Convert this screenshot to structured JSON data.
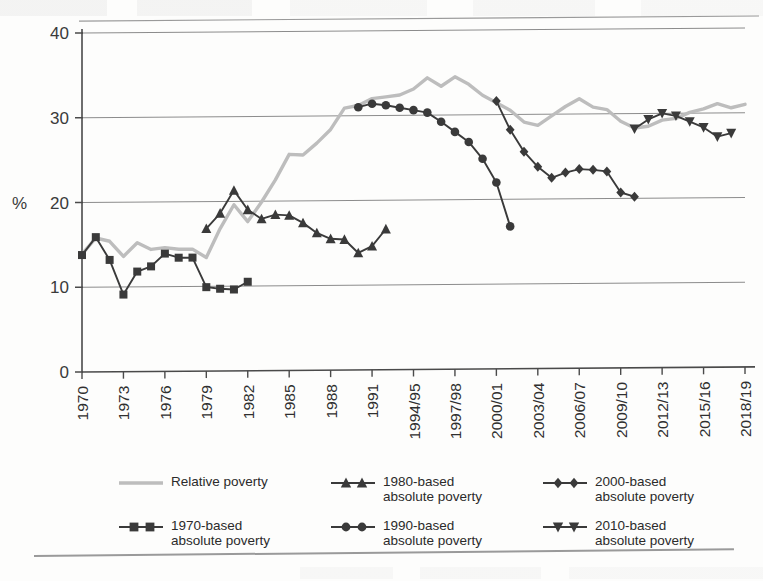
{
  "axes": {
    "ylabel": "%",
    "yticks": [
      "0",
      "10",
      "20",
      "30",
      "40"
    ],
    "ylim": [
      0,
      40
    ],
    "xticks": [
      "1970",
      "1973",
      "1976",
      "1979",
      "1982",
      "1985",
      "1988",
      "1991",
      "1994/95",
      "1997/98",
      "2000/01",
      "2003/04",
      "2006/07",
      "2009/10",
      "2012/13",
      "2015/16",
      "2018/19"
    ]
  },
  "legend": {
    "items": [
      {
        "key": "relative",
        "label": "Relative poverty",
        "marker": "line",
        "color": "#bdbdbd"
      },
      {
        "key": "b1980",
        "label": "1980-based\nabsolute poverty",
        "marker": "triangle-up",
        "color": "#3a3a3a"
      },
      {
        "key": "b2000",
        "label": "2000-based\nabsolute poverty",
        "marker": "diamond",
        "color": "#3a3a3a"
      },
      {
        "key": "b1970",
        "label": "1970-based\nabsolute poverty",
        "marker": "square",
        "color": "#3a3a3a"
      },
      {
        "key": "b1990",
        "label": "1990-based\nabsolute poverty",
        "marker": "circle",
        "color": "#3a3a3a"
      },
      {
        "key": "b2010",
        "label": "2010-based\nabsolute poverty",
        "marker": "triangle-down",
        "color": "#3a3a3a"
      }
    ]
  },
  "chart_data": {
    "type": "line",
    "title": "",
    "xlabel": "",
    "ylabel": "%",
    "ylim": [
      0,
      40
    ],
    "grid": "horizontal",
    "legend_position": "bottom",
    "categories": [
      "1970",
      "1971",
      "1972",
      "1973",
      "1974",
      "1975",
      "1976",
      "1977",
      "1978",
      "1979",
      "1980",
      "1981",
      "1982",
      "1983",
      "1984",
      "1985",
      "1986",
      "1987",
      "1988",
      "1989",
      "1990",
      "1991",
      "1992/93",
      "1993/94",
      "1994/95",
      "1995/96",
      "1996/97",
      "1997/98",
      "1998/99",
      "1999/00",
      "2000/01",
      "2001/02",
      "2002/03",
      "2003/04",
      "2004/05",
      "2005/06",
      "2006/07",
      "2007/08",
      "2008/09",
      "2009/10",
      "2010/11",
      "2011/12",
      "2012/13",
      "2013/14",
      "2014/15",
      "2015/16",
      "2016/17",
      "2017/18",
      "2018/19"
    ],
    "series": [
      {
        "name": "Relative poverty",
        "marker": "line",
        "color": "#bdbdbd",
        "points": [
          {
            "x": "1970",
            "y": 13.9
          },
          {
            "x": "1971",
            "y": 15.8
          },
          {
            "x": "1972",
            "y": 15.4
          },
          {
            "x": "1973",
            "y": 13.6
          },
          {
            "x": "1974",
            "y": 15.2
          },
          {
            "x": "1975",
            "y": 14.4
          },
          {
            "x": "1976",
            "y": 14.6
          },
          {
            "x": "1977",
            "y": 14.4
          },
          {
            "x": "1978",
            "y": 14.4
          },
          {
            "x": "1979",
            "y": 13.4
          },
          {
            "x": "1980",
            "y": 16.8
          },
          {
            "x": "1981",
            "y": 19.6
          },
          {
            "x": "1982",
            "y": 17.6
          },
          {
            "x": "1983",
            "y": 19.9
          },
          {
            "x": "1984",
            "y": 22.5
          },
          {
            "x": "1985",
            "y": 25.5
          },
          {
            "x": "1986",
            "y": 25.4
          },
          {
            "x": "1987",
            "y": 26.8
          },
          {
            "x": "1988",
            "y": 28.4
          },
          {
            "x": "1989",
            "y": 30.9
          },
          {
            "x": "1990",
            "y": 31.2
          },
          {
            "x": "1991",
            "y": 32.0
          },
          {
            "x": "1992/93",
            "y": 32.2
          },
          {
            "x": "1993/94",
            "y": 32.4
          },
          {
            "x": "1994/95",
            "y": 33.1
          },
          {
            "x": "1995/96",
            "y": 34.4
          },
          {
            "x": "1996/97",
            "y": 33.4
          },
          {
            "x": "1997/98",
            "y": 34.5
          },
          {
            "x": "1998/99",
            "y": 33.6
          },
          {
            "x": "1999/00",
            "y": 32.3
          },
          {
            "x": "2000/01",
            "y": 31.4
          },
          {
            "x": "2001/02",
            "y": 30.5
          },
          {
            "x": "2002/03",
            "y": 29.1
          },
          {
            "x": "2003/04",
            "y": 28.7
          },
          {
            "x": "2004/05",
            "y": 29.8
          },
          {
            "x": "2005/06",
            "y": 30.9
          },
          {
            "x": "2006/07",
            "y": 31.8
          },
          {
            "x": "2007/08",
            "y": 30.8
          },
          {
            "x": "2008/09",
            "y": 30.5
          },
          {
            "x": "2009/10",
            "y": 29.1
          },
          {
            "x": "2010/11",
            "y": 28.3
          },
          {
            "x": "2011/12",
            "y": 28.5
          },
          {
            "x": "2012/13",
            "y": 29.2
          },
          {
            "x": "2013/14",
            "y": 29.4
          },
          {
            "x": "2014/15",
            "y": 30.1
          },
          {
            "x": "2015/16",
            "y": 30.5
          },
          {
            "x": "2016/17",
            "y": 31.1
          },
          {
            "x": "2017/18",
            "y": 30.6
          },
          {
            "x": "2018/19",
            "y": 31.0
          }
        ]
      },
      {
        "name": "1970-based absolute poverty",
        "marker": "square",
        "color": "#3a3a3a",
        "points": [
          {
            "x": "1970",
            "y": 13.8
          },
          {
            "x": "1971",
            "y": 15.9
          },
          {
            "x": "1972",
            "y": 13.2
          },
          {
            "x": "1973",
            "y": 9.1
          },
          {
            "x": "1974",
            "y": 11.8
          },
          {
            "x": "1975",
            "y": 12.4
          },
          {
            "x": "1976",
            "y": 13.9
          },
          {
            "x": "1977",
            "y": 13.4
          },
          {
            "x": "1978",
            "y": 13.4
          },
          {
            "x": "1979",
            "y": 9.9
          },
          {
            "x": "1980",
            "y": 9.7
          },
          {
            "x": "1981",
            "y": 9.6
          },
          {
            "x": "1982",
            "y": 10.5
          }
        ]
      },
      {
        "name": "1980-based absolute poverty",
        "marker": "triangle-up",
        "color": "#3a3a3a",
        "points": [
          {
            "x": "1979",
            "y": 16.8
          },
          {
            "x": "1980",
            "y": 18.6
          },
          {
            "x": "1981",
            "y": 21.3
          },
          {
            "x": "1982",
            "y": 19.0
          },
          {
            "x": "1983",
            "y": 17.9
          },
          {
            "x": "1984",
            "y": 18.4
          },
          {
            "x": "1985",
            "y": 18.3
          },
          {
            "x": "1986",
            "y": 17.4
          },
          {
            "x": "1987",
            "y": 16.2
          },
          {
            "x": "1988",
            "y": 15.5
          },
          {
            "x": "1989",
            "y": 15.4
          },
          {
            "x": "1990",
            "y": 13.8
          },
          {
            "x": "1991",
            "y": 14.6
          },
          {
            "x": "1992/93",
            "y": 16.6
          }
        ]
      },
      {
        "name": "1990-based absolute poverty",
        "marker": "circle",
        "color": "#3a3a3a",
        "points": [
          {
            "x": "1990",
            "y": 31.0
          },
          {
            "x": "1991",
            "y": 31.4
          },
          {
            "x": "1992/93",
            "y": 31.2
          },
          {
            "x": "1993/94",
            "y": 30.9
          },
          {
            "x": "1994/95",
            "y": 30.6
          },
          {
            "x": "1995/96",
            "y": 30.3
          },
          {
            "x": "1996/97",
            "y": 29.2
          },
          {
            "x": "1997/98",
            "y": 28.0
          },
          {
            "x": "1998/99",
            "y": 26.8
          },
          {
            "x": "1999/00",
            "y": 24.8
          },
          {
            "x": "2000/01",
            "y": 22.0
          },
          {
            "x": "2001/02",
            "y": 16.8
          }
        ]
      },
      {
        "name": "2000-based absolute poverty",
        "marker": "diamond",
        "color": "#3a3a3a",
        "points": [
          {
            "x": "2000/01",
            "y": 31.6
          },
          {
            "x": "2001/02",
            "y": 28.2
          },
          {
            "x": "2002/03",
            "y": 25.6
          },
          {
            "x": "2003/04",
            "y": 23.8
          },
          {
            "x": "2004/05",
            "y": 22.5
          },
          {
            "x": "2005/06",
            "y": 23.1
          },
          {
            "x": "2006/07",
            "y": 23.5
          },
          {
            "x": "2007/08",
            "y": 23.4
          },
          {
            "x": "2008/09",
            "y": 23.2
          },
          {
            "x": "2009/10",
            "y": 20.7
          },
          {
            "x": "2010/11",
            "y": 20.2
          }
        ]
      },
      {
        "name": "2010-based absolute poverty",
        "marker": "triangle-down",
        "color": "#3a3a3a",
        "points": [
          {
            "x": "2010/11",
            "y": 28.2
          },
          {
            "x": "2011/12",
            "y": 29.3
          },
          {
            "x": "2012/13",
            "y": 30.0
          },
          {
            "x": "2013/14",
            "y": 29.7
          },
          {
            "x": "2014/15",
            "y": 29.0
          },
          {
            "x": "2015/16",
            "y": 28.3
          },
          {
            "x": "2016/17",
            "y": 27.2
          },
          {
            "x": "2017/18",
            "y": 27.6
          }
        ]
      }
    ]
  }
}
